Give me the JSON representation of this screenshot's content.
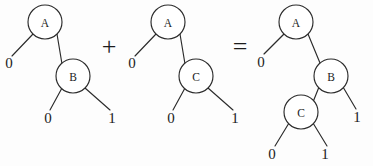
{
  "figure": {
    "background_color": "#fdfdfd",
    "ink_color": "#2b2b2b",
    "width": 373,
    "height": 166
  },
  "operators": [
    {
      "name": "plus",
      "symbol": "+",
      "x": 109,
      "y": 46
    },
    {
      "name": "equals",
      "symbol": "=",
      "x": 240,
      "y": 46
    }
  ],
  "trees": [
    {
      "name": "tree-left",
      "nodes": [
        {
          "id": "a",
          "label": "A",
          "cx": 45,
          "cy": 22,
          "r": 17
        },
        {
          "id": "b",
          "label": "B",
          "cx": 73,
          "cy": 76,
          "r": 17
        }
      ],
      "edges": [
        {
          "id": "a-low",
          "from": "a",
          "to": "leaf-0-left",
          "x1": 33,
          "y1": 34,
          "x2": 12,
          "y2": 56
        },
        {
          "id": "a-high",
          "from": "a",
          "to": "b",
          "x1": 57,
          "y1": 34,
          "x2": 62,
          "y2": 64
        },
        {
          "id": "b-low",
          "from": "b",
          "to": "leaf-0-mid",
          "x1": 62,
          "y1": 88,
          "x2": 50,
          "y2": 110
        },
        {
          "id": "b-high",
          "from": "b",
          "to": "leaf-1-right",
          "x1": 85,
          "y1": 88,
          "x2": 110,
          "y2": 110
        }
      ],
      "leaves": [
        {
          "id": "leaf-0-left",
          "label": "0",
          "x": 9,
          "y": 63
        },
        {
          "id": "leaf-0-mid",
          "label": "0",
          "x": 48,
          "y": 118
        },
        {
          "id": "leaf-1-right",
          "label": "1",
          "x": 112,
          "y": 118
        }
      ]
    },
    {
      "name": "tree-middle",
      "nodes": [
        {
          "id": "a",
          "label": "A",
          "cx": 168,
          "cy": 22,
          "r": 17
        },
        {
          "id": "c",
          "label": "C",
          "cx": 196,
          "cy": 76,
          "r": 17
        }
      ],
      "edges": [
        {
          "id": "a-low",
          "from": "a",
          "to": "leaf-0-left",
          "x1": 156,
          "y1": 34,
          "x2": 135,
          "y2": 56
        },
        {
          "id": "a-high",
          "from": "a",
          "to": "c",
          "x1": 180,
          "y1": 34,
          "x2": 185,
          "y2": 64
        },
        {
          "id": "c-low",
          "from": "c",
          "to": "leaf-0-mid",
          "x1": 185,
          "y1": 88,
          "x2": 173,
          "y2": 110
        },
        {
          "id": "c-high",
          "from": "c",
          "to": "leaf-1-right",
          "x1": 208,
          "y1": 88,
          "x2": 233,
          "y2": 110
        }
      ],
      "leaves": [
        {
          "id": "leaf-0-left",
          "label": "0",
          "x": 132,
          "y": 63
        },
        {
          "id": "leaf-0-mid",
          "label": "0",
          "x": 171,
          "y": 118
        },
        {
          "id": "leaf-1-right",
          "label": "1",
          "x": 235,
          "y": 118
        }
      ]
    },
    {
      "name": "tree-result",
      "nodes": [
        {
          "id": "a",
          "label": "A",
          "cx": 296,
          "cy": 22,
          "r": 17
        },
        {
          "id": "b",
          "label": "B",
          "cx": 331,
          "cy": 76,
          "r": 17
        },
        {
          "id": "c",
          "label": "C",
          "cx": 301,
          "cy": 112,
          "r": 17
        }
      ],
      "edges": [
        {
          "id": "a-low",
          "from": "a",
          "to": "leaf-0-left",
          "x1": 284,
          "y1": 34,
          "x2": 264,
          "y2": 54
        },
        {
          "id": "a-high",
          "from": "a",
          "to": "b",
          "x1": 308,
          "y1": 34,
          "x2": 320,
          "y2": 63
        },
        {
          "id": "b-low",
          "from": "b",
          "to": "c",
          "x1": 319,
          "y1": 87,
          "x2": 313,
          "y2": 102
        },
        {
          "id": "b-high",
          "from": "b",
          "to": "leaf-1-right",
          "x1": 343,
          "y1": 87,
          "x2": 356,
          "y2": 109
        },
        {
          "id": "c-low",
          "from": "c",
          "to": "leaf-0-bottom",
          "x1": 289,
          "y1": 123,
          "x2": 275,
          "y2": 146
        },
        {
          "id": "c-high",
          "from": "c",
          "to": "leaf-1-bottom",
          "x1": 313,
          "y1": 123,
          "x2": 327,
          "y2": 146
        }
      ],
      "leaves": [
        {
          "id": "leaf-0-left",
          "label": "0",
          "x": 261,
          "y": 62
        },
        {
          "id": "leaf-1-right",
          "label": "1",
          "x": 357,
          "y": 117
        },
        {
          "id": "leaf-0-bottom",
          "label": "0",
          "x": 272,
          "y": 154
        },
        {
          "id": "leaf-1-bottom",
          "label": "1",
          "x": 325,
          "y": 154
        }
      ]
    }
  ]
}
